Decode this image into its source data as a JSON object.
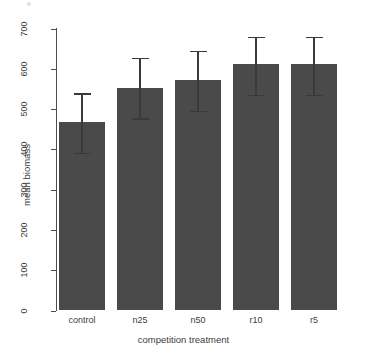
{
  "chart_data": {
    "type": "bar",
    "title": "",
    "xlabel": "competition treatment",
    "ylabel": "mean biomass",
    "categories": [
      "control",
      "n25",
      "n50",
      "r10",
      "r5"
    ],
    "values": [
      467,
      553,
      573,
      611,
      611
    ],
    "error_upper": [
      539,
      628,
      645,
      680,
      680
    ],
    "error_lower": [
      392,
      477,
      496,
      536,
      536
    ],
    "ylim": [
      0,
      700
    ],
    "yticks": [
      0,
      100,
      200,
      300,
      400,
      500,
      600,
      700
    ],
    "ytick_labels": [
      "0",
      "100",
      "200",
      "300",
      "400",
      "500",
      "600",
      "700"
    ],
    "grid": false,
    "legend": null,
    "bar_color": "#4a4a4a",
    "axis_color": "#4d4d4d",
    "error_bar_color": "#3a3a3a",
    "background": "#ffffff"
  },
  "axis": {
    "y_title": "mean biomass",
    "x_title": "competition treatment"
  }
}
